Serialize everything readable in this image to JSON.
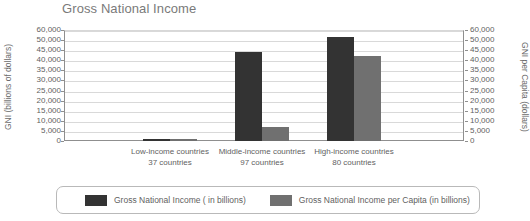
{
  "chart_data": {
    "type": "bar",
    "title": "Gross National Income",
    "xlabel": "",
    "ylabel": "GNI (billions of dollars)",
    "y2label": "GNI per Capita (dollars)",
    "categories": [
      "Low-income countries",
      "Middle-income countries",
      "High-income countries"
    ],
    "category_sublabels": [
      "37 countries",
      "97 countries",
      "80 countries"
    ],
    "series": [
      {
        "name": "Gross National Income ( in billions)",
        "color": "#333333",
        "axis": "left",
        "values": [
          1200,
          44000,
          53000
        ]
      },
      {
        "name": "Gross National Income per Capita (in billions)",
        "color": "#707070",
        "axis": "right",
        "values": [
          900,
          7000,
          42000
        ]
      }
    ],
    "ylim": [
      0,
      60000
    ],
    "y2lim": [
      0,
      60000
    ],
    "yticks": [
      0,
      5000,
      10000,
      15000,
      20000,
      25000,
      30000,
      35000,
      40000,
      45000,
      50000,
      60000
    ],
    "ytick_labels": [
      "0",
      "5,000",
      "10,000",
      "15,000",
      "20,000",
      "25,000",
      "30,000",
      "35,000",
      "40,000",
      "45,000",
      "50,000",
      "60,000"
    ],
    "y2ticks": [
      0,
      5000,
      10000,
      15000,
      20000,
      25000,
      30000,
      35000,
      40000,
      45000,
      50000,
      60000
    ],
    "y2tick_labels": [
      "0",
      "5,000",
      "10,000",
      "15,000",
      "20,000",
      "25,000",
      "30,000",
      "35,000",
      "40,000",
      "45,000",
      "50,000",
      "60,000"
    ],
    "grid": true,
    "legend_position": "bottom"
  }
}
